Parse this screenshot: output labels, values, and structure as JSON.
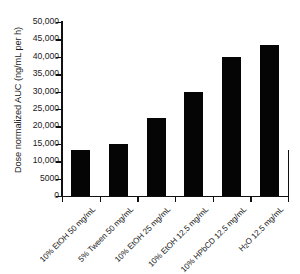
{
  "chart_data": {
    "type": "bar",
    "title": "",
    "xlabel": "",
    "ylabel": "Dose normalized AUC (ng/mL per h)",
    "categories": [
      "10% EtOH 50 mg/mL",
      "5% Tween 50 mg/mL",
      "10% EtOH 25 mg/mL",
      "10% EtOH 12.5 mg/mL",
      "10% HPbCD 12.5 mg/mL",
      "H2O 12.5 mg/mL"
    ],
    "category_labels_html": [
      "10% EtOH 50 mg/mL",
      "5% Tween 50 mg/mL",
      "10% EtOH 25 mg/mL",
      "10% EtOH 12.5 mg/mL",
      "10% HPbCD 12.5 mg/mL",
      "H<sub>2</sub>O 12.5 mg/mL"
    ],
    "values": [
      13200,
      15000,
      22500,
      29800,
      40000,
      43500
    ],
    "ylim": [
      0,
      50000
    ],
    "yticks": [
      0,
      5000,
      10000,
      15000,
      20000,
      25000,
      30000,
      35000,
      40000,
      45000,
      50000
    ],
    "ytick_labels": [
      "0",
      "5000",
      "10,000",
      "15,000",
      "20,000",
      "25,000",
      "30,000",
      "35,000",
      "40,000",
      "45,000",
      "50,000"
    ],
    "grid": false,
    "legend": null,
    "bar_color": "#050505",
    "axis_color": "#111111",
    "background_color": "#ffffff"
  }
}
